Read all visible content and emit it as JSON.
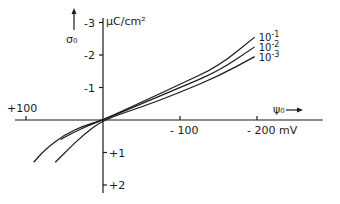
{
  "chart_data": {
    "type": "line",
    "title": "",
    "xlabel": "ψ₀",
    "xlabel_arrow": "→",
    "x_unit": "mV",
    "ylabel": "σ₀",
    "ylabel_arrow": "↑",
    "y_unit": "μC/cm²",
    "x_ticks": [
      {
        "value": 100,
        "label": "+100"
      },
      {
        "value": -100,
        "label": "- 100"
      },
      {
        "value": -200,
        "label": "- 200  mV"
      }
    ],
    "y_ticks": [
      {
        "value": -3,
        "label": "-3"
      },
      {
        "value": -2,
        "label": "-2"
      },
      {
        "value": -1,
        "label": "-1"
      },
      {
        "value": 1,
        "label": "+1"
      },
      {
        "value": 2,
        "label": "+2"
      }
    ],
    "xlim": [
      130,
      -230
    ],
    "ylim": [
      2.2,
      -3.2
    ],
    "grid": false,
    "legend_position": "inline-right",
    "series": [
      {
        "name": "10^-1",
        "label_base": "10",
        "label_exp": "-1",
        "points": [
          [
            90,
            1.3
          ],
          [
            75,
            0.9
          ],
          [
            50,
            0.45
          ],
          [
            25,
            0.18
          ],
          [
            0,
            0
          ],
          [
            -50,
            -0.55
          ],
          [
            -100,
            -1.1
          ],
          [
            -150,
            -1.65
          ],
          [
            -197,
            -2.55
          ]
        ]
      },
      {
        "name": "10^-2",
        "label_base": "10",
        "label_exp": "-2",
        "points": [
          [
            55,
            0.6
          ],
          [
            40,
            0.4
          ],
          [
            20,
            0.18
          ],
          [
            0,
            0
          ],
          [
            -50,
            -0.5
          ],
          [
            -100,
            -1.0
          ],
          [
            -150,
            -1.5
          ],
          [
            -197,
            -2.25
          ]
        ]
      },
      {
        "name": "10^-3",
        "label_base": "10",
        "label_exp": "-3",
        "points": [
          [
            62,
            1.3
          ],
          [
            45,
            0.9
          ],
          [
            25,
            0.45
          ],
          [
            0,
            0
          ],
          [
            -50,
            -0.4
          ],
          [
            -100,
            -0.85
          ],
          [
            -150,
            -1.35
          ],
          [
            -197,
            -1.95
          ]
        ]
      }
    ]
  }
}
